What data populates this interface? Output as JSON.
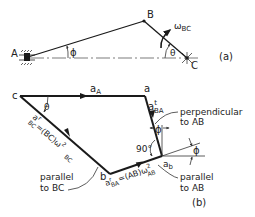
{
  "figure_a": {
    "tag": "(a)",
    "points": {
      "A": "A",
      "B": "B",
      "C": "C"
    },
    "angle_A": "ϕ",
    "angle_C": "θ",
    "omega": "ω",
    "omega_sub": "BC"
  },
  "figure_b": {
    "tag": "(b)",
    "points": {
      "c": "c",
      "a": "a",
      "b": "b"
    },
    "a_A": {
      "main": "a",
      "sub": "A"
    },
    "a_t_BA": {
      "main": "a",
      "sup": "t",
      "sub": "BA"
    },
    "a_r_BC": {
      "main": "a",
      "sup": "r",
      "sub": "BC",
      "eq": "=(BC)ω",
      "eq_sup": "2",
      "eq_sub": "BC"
    },
    "a_r_BA": {
      "main": "a",
      "sup": "r",
      "sub": "BA",
      "eq": "=(AB)ω",
      "eq_sup": "2",
      "eq_sub": "AB"
    },
    "a_b": {
      "main": "a",
      "sub": "b"
    },
    "angle_c": "θ",
    "angle_phi_top": "ϕ",
    "angle_phi_right": "ϕ",
    "right_angle": "90°",
    "perpendicular_label": [
      "perpendicular",
      "to AB"
    ],
    "parallel_bc_label": [
      "parallel",
      "to BC"
    ],
    "parallel_ab_label": [
      "parallel",
      "to AB"
    ]
  }
}
